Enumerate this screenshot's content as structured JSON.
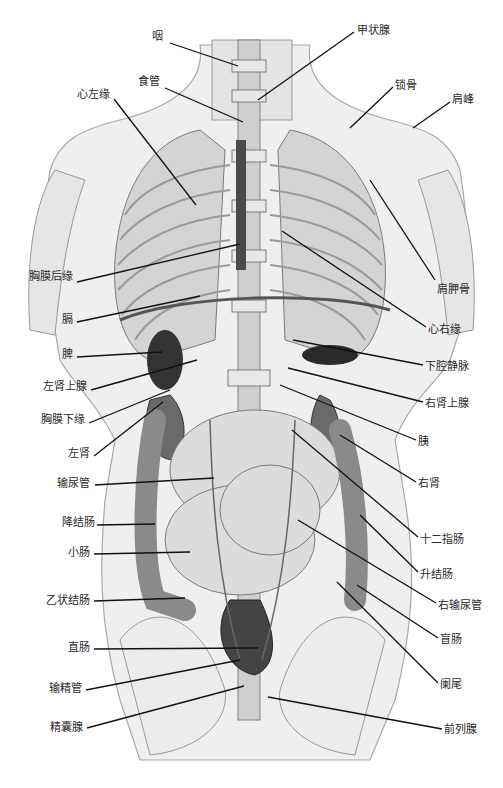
{
  "figure": {
    "caption": "",
    "colors": {
      "background": "#ffffff",
      "body_fill": "#ececec",
      "body_stroke": "#9a9a9a",
      "organ_dark": "#3a3a3a",
      "organ_mid": "#8a8a8a",
      "organ_light": "#d8d8d8",
      "leader": "#111111",
      "label": "#2a2a2a"
    },
    "labels_left": [
      {
        "text": "咽",
        "x": 163,
        "y": 37,
        "line": [
          170,
          43,
          238,
          66
        ]
      },
      {
        "text": "食管",
        "x": 160,
        "y": 82,
        "line": [
          165,
          88,
          243,
          122
        ]
      },
      {
        "text": "心左缘",
        "x": 110,
        "y": 95,
        "line": [
          114,
          99,
          196,
          205
        ]
      },
      {
        "text": "胸膜后缘",
        "x": 73,
        "y": 277,
        "line": [
          77,
          282,
          240,
          244
        ]
      },
      {
        "text": "膈",
        "x": 73,
        "y": 320,
        "line": [
          77,
          322,
          200,
          296
        ]
      },
      {
        "text": "脾",
        "x": 73,
        "y": 355,
        "line": [
          77,
          357,
          162,
          352
        ]
      },
      {
        "text": "左肾上腺",
        "x": 87,
        "y": 387,
        "line": [
          91,
          390,
          197,
          360
        ]
      },
      {
        "text": "胸膜下缘",
        "x": 85,
        "y": 420,
        "line": [
          89,
          423,
          170,
          390
        ]
      },
      {
        "text": "左肾",
        "x": 90,
        "y": 454,
        "line": [
          94,
          456,
          163,
          402
        ]
      },
      {
        "text": "输尿管",
        "x": 90,
        "y": 484,
        "line": [
          95,
          485,
          214,
          478
        ]
      },
      {
        "text": "降结肠",
        "x": 95,
        "y": 523,
        "line": [
          97,
          525,
          155,
          524
        ]
      },
      {
        "text": "小肠",
        "x": 90,
        "y": 553,
        "line": [
          94,
          554,
          190,
          552
        ]
      },
      {
        "text": "乙状结肠",
        "x": 90,
        "y": 601,
        "line": [
          94,
          601,
          185,
          598
        ]
      },
      {
        "text": "直肠",
        "x": 90,
        "y": 648,
        "line": [
          94,
          649,
          258,
          648
        ]
      },
      {
        "text": "输精管",
        "x": 82,
        "y": 689,
        "line": [
          86,
          690,
          240,
          660
        ]
      },
      {
        "text": "精囊腺",
        "x": 83,
        "y": 728,
        "line": [
          87,
          728,
          244,
          686
        ]
      }
    ],
    "labels_right": [
      {
        "text": "甲状腺",
        "x": 357,
        "y": 31,
        "line": [
          354,
          32,
          258,
          100
        ]
      },
      {
        "text": "锁骨",
        "x": 395,
        "y": 86,
        "line": [
          393,
          87,
          350,
          128
        ]
      },
      {
        "text": "肩峰",
        "x": 452,
        "y": 100,
        "line": [
          450,
          102,
          413,
          128
        ]
      },
      {
        "text": "肩胛骨",
        "x": 437,
        "y": 290,
        "line": [
          435,
          280,
          370,
          180
        ]
      },
      {
        "text": "心右缘",
        "x": 428,
        "y": 330,
        "line": [
          426,
          327,
          282,
          231
        ]
      },
      {
        "text": "下腔静脉",
        "x": 425,
        "y": 367,
        "line": [
          423,
          365,
          293,
          340
        ]
      },
      {
        "text": "右肾上腺",
        "x": 425,
        "y": 404,
        "line": [
          423,
          402,
          288,
          368
        ]
      },
      {
        "text": "胰",
        "x": 418,
        "y": 442,
        "line": [
          416,
          440,
          280,
          385
        ]
      },
      {
        "text": "右肾",
        "x": 418,
        "y": 484,
        "line": [
          416,
          482,
          340,
          435
        ]
      },
      {
        "text": "十二指肠",
        "x": 420,
        "y": 540,
        "line": [
          418,
          537,
          292,
          430
        ]
      },
      {
        "text": "升结肠",
        "x": 420,
        "y": 575,
        "line": [
          418,
          572,
          360,
          515
        ]
      },
      {
        "text": "右输尿管",
        "x": 438,
        "y": 606,
        "line": [
          436,
          603,
          298,
          520
        ]
      },
      {
        "text": "盲肠",
        "x": 440,
        "y": 640,
        "line": [
          438,
          638,
          357,
          585
        ]
      },
      {
        "text": "阑尾",
        "x": 440,
        "y": 685,
        "line": [
          438,
          683,
          337,
          582
        ]
      },
      {
        "text": "前列腺",
        "x": 444,
        "y": 730,
        "line": [
          442,
          729,
          268,
          697
        ]
      }
    ]
  }
}
